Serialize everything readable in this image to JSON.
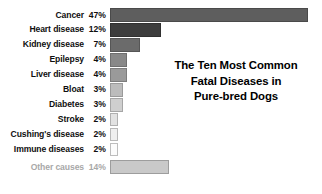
{
  "chart_data": {
    "type": "bar",
    "orientation": "horizontal",
    "title_lines": [
      "The Ten Most Common",
      "Fatal Diseases in",
      "Pure-bred Dogs"
    ],
    "xlabel": "",
    "ylabel": "",
    "xlim": [
      0,
      47
    ],
    "grid": false,
    "legend": "none",
    "categories": [
      "Cancer",
      "Heart disease",
      "Kidney disease",
      "Epilepsy",
      "Liver disease",
      "Bloat",
      "Diabetes",
      "Stroke",
      "Cushing's disease",
      "Immune diseases",
      "Other causes"
    ],
    "values": [
      47,
      12,
      7,
      4,
      4,
      3,
      3,
      2,
      2,
      2,
      14
    ],
    "value_labels": [
      "47%",
      "12%",
      "7%",
      "4%",
      "4%",
      "3%",
      "3%",
      "2%",
      "2%",
      "2%",
      "14%"
    ],
    "bars": [
      {
        "label": "Cancer",
        "value": 47,
        "value_label": "47%",
        "fill": "#5e5e5e",
        "stroke": "#4a4a4a",
        "muted": false
      },
      {
        "label": "Heart disease",
        "value": 12,
        "value_label": "12%",
        "fill": "#3d3d3d",
        "stroke": "#303030",
        "muted": false
      },
      {
        "label": "Kidney disease",
        "value": 7,
        "value_label": "7%",
        "fill": "#6b6b6b",
        "stroke": "#565656",
        "muted": false
      },
      {
        "label": "Epilepsy",
        "value": 4,
        "value_label": "4%",
        "fill": "#888888",
        "stroke": "#6f6f6f",
        "muted": false
      },
      {
        "label": "Liver disease",
        "value": 4,
        "value_label": "4%",
        "fill": "#9a9a9a",
        "stroke": "#7d7d7d",
        "muted": false
      },
      {
        "label": "Bloat",
        "value": 3,
        "value_label": "3%",
        "fill": "#bcbcbc",
        "stroke": "#9a9a9a",
        "muted": false
      },
      {
        "label": "Diabetes",
        "value": 3,
        "value_label": "3%",
        "fill": "#cfcfcf",
        "stroke": "#a6a6a6",
        "muted": false
      },
      {
        "label": "Stroke",
        "value": 2,
        "value_label": "2%",
        "fill": "#e2e2e2",
        "stroke": "#b0b0b0",
        "muted": false
      },
      {
        "label": "Cushing's disease",
        "value": 2,
        "value_label": "2%",
        "fill": "#efefef",
        "stroke": "#b8b8b8",
        "muted": false
      },
      {
        "label": "Immune diseases",
        "value": 2,
        "value_label": "2%",
        "fill": "#fcfcfc",
        "stroke": "#bdbdbd",
        "muted": false
      },
      {
        "label": "Other causes",
        "value": 14,
        "value_label": "14%",
        "fill": "#c9c9c9",
        "stroke": "#9d9d9d",
        "muted": true
      }
    ],
    "colors": {
      "background": "#ffffff",
      "label_text": "#0f0f0f",
      "muted_text": "#a8a8a8",
      "title_text": "#000000"
    },
    "scale": {
      "bar_origin_px": 112,
      "px_per_percent": 4.22,
      "max_bar_px": 198
    }
  }
}
